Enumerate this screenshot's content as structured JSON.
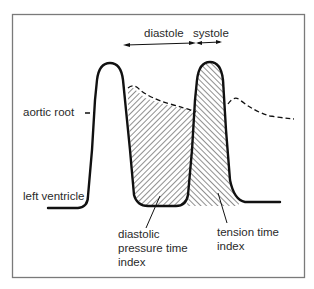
{
  "diagram": {
    "phase_labels": {
      "diastole": "diastole",
      "systole": "systole"
    },
    "curve_labels": {
      "aortic_root": "aortic root",
      "left_ventricle": "left ventricle"
    },
    "area_labels": {
      "diastolic_pressure_time_index": [
        "diastolic",
        "pressure time",
        "index"
      ],
      "tension_time_index": [
        "tension time",
        "index"
      ]
    },
    "colors": {
      "line": "#111111",
      "frame": "#7a7a7a",
      "hatch": "#222222",
      "text": "#2a2a2a"
    }
  }
}
